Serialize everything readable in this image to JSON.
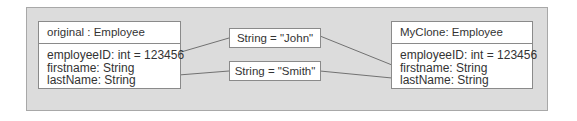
{
  "diagram": {
    "objects": [
      {
        "id": "original",
        "title": "original : Employee",
        "attributes": [
          "employeeID: int = 123456",
          "firstname: String",
          "lastName: String"
        ]
      },
      {
        "id": "clone",
        "title": "MyClone: Employee",
        "attributes": [
          "employeeID: int = 123456",
          "firstname: String",
          "lastName: String"
        ]
      }
    ],
    "values": [
      {
        "id": "john",
        "label": "String = \"John\""
      },
      {
        "id": "smith",
        "label": "String = \"Smith\""
      }
    ],
    "connections": [
      {
        "from": "original.firstname",
        "to": "john"
      },
      {
        "from": "original.lastName",
        "to": "smith"
      },
      {
        "from": "john",
        "to": "clone.firstname"
      },
      {
        "from": "smith",
        "to": "clone.lastName"
      }
    ],
    "colors": {
      "panel": "#dcdcdc",
      "border": "#8a8a8a",
      "box": "#ffffff",
      "line": "#555555"
    }
  }
}
